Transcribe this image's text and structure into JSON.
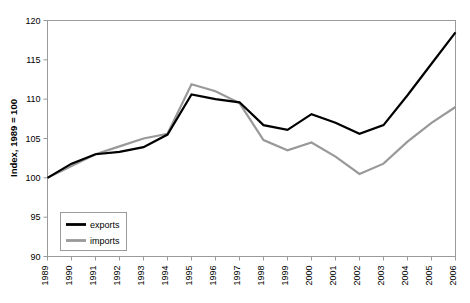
{
  "chart_data": {
    "type": "line",
    "title": "",
    "subtitle": "",
    "xlabel": "",
    "ylabel": "Index, 1989 = 100",
    "categories": [
      "1989",
      "1990",
      "1991",
      "1992",
      "1993",
      "1994",
      "1995",
      "1996",
      "1997",
      "1998",
      "1999",
      "2000",
      "2001",
      "2002",
      "2003",
      "2004",
      "2005",
      "2006"
    ],
    "ylim": [
      90,
      120
    ],
    "yticks": [
      90,
      95,
      100,
      105,
      110,
      115,
      120
    ],
    "ytick_labels": [
      "90",
      "95",
      "100",
      "105",
      "110",
      "115",
      "120"
    ],
    "grid": false,
    "legend_position": "bottom-left",
    "series": [
      {
        "name": "exports",
        "color": "#000000",
        "width": 2.2,
        "values": [
          100.0,
          101.8,
          103.0,
          103.3,
          103.9,
          105.5,
          110.6,
          110.0,
          109.6,
          106.7,
          106.1,
          108.1,
          107.0,
          105.6,
          106.7,
          110.5,
          114.5,
          118.5
        ]
      },
      {
        "name": "imports",
        "color": "#999999",
        "width": 2.2,
        "values": [
          100.0,
          101.5,
          103.0,
          104.0,
          105.0,
          105.6,
          111.9,
          111.0,
          109.5,
          104.8,
          103.5,
          104.5,
          102.7,
          100.5,
          101.8,
          104.6,
          107.0,
          109.0
        ]
      }
    ]
  },
  "legend": {
    "items": [
      {
        "label": "exports"
      },
      {
        "label": "imports"
      }
    ]
  },
  "colors": {
    "exports": "#000000",
    "imports": "#999999",
    "axis": "#9a9a9a",
    "background": "#ffffff"
  }
}
